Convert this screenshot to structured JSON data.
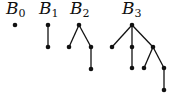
{
  "trees": [
    {
      "label": "B",
      "sub": "0",
      "lx": 6,
      "ly": 0,
      "nodes": [
        [
          15,
          25
        ]
      ],
      "edges": []
    },
    {
      "label": "B",
      "sub": "1",
      "lx": 39,
      "ly": 0,
      "nodes": [
        [
          48,
          25
        ],
        [
          48,
          47
        ]
      ],
      "edges": [
        [
          0,
          1
        ]
      ]
    },
    {
      "label": "B",
      "sub": "2",
      "lx": 70,
      "ly": 0,
      "nodes": [
        [
          79,
          25
        ],
        [
          69,
          47
        ],
        [
          91,
          47
        ],
        [
          91,
          69
        ]
      ],
      "edges": [
        [
          0,
          1
        ],
        [
          0,
          2
        ],
        [
          2,
          3
        ]
      ]
    },
    {
      "label": "B",
      "sub": "3",
      "lx": 122,
      "ly": 0,
      "nodes": [
        [
          132,
          25
        ],
        [
          112,
          47
        ],
        [
          132,
          47
        ],
        [
          153,
          47
        ],
        [
          132,
          68
        ],
        [
          144,
          68
        ],
        [
          164,
          68
        ],
        [
          164,
          90
        ]
      ],
      "edges": [
        [
          0,
          1
        ],
        [
          0,
          2
        ],
        [
          0,
          3
        ],
        [
          2,
          4
        ],
        [
          3,
          5
        ],
        [
          3,
          6
        ],
        [
          6,
          7
        ]
      ]
    }
  ]
}
